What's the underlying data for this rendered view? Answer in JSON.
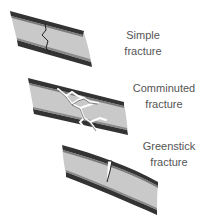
{
  "diagram": {
    "background": "#ffffff",
    "bone_fill": "#c8c8c8",
    "cortex_color": "#3a3a3a",
    "crack_color": "#ffffff",
    "fractures": [
      {
        "id": "simple",
        "line1": "Simple",
        "line2": "fracture"
      },
      {
        "id": "comminuted",
        "line1": "Comminuted",
        "line2": "fracture"
      },
      {
        "id": "greenstick",
        "line1": "Greenstick",
        "line2": "fracture"
      }
    ]
  }
}
